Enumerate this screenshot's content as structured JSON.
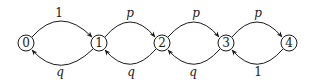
{
  "diagram": {
    "type": "markov-chain",
    "nodes": [
      {
        "id": "0",
        "label": "0",
        "x": 26,
        "y": 43
      },
      {
        "id": "1",
        "label": "1",
        "x": 99,
        "y": 43
      },
      {
        "id": "2",
        "label": "2",
        "x": 162,
        "y": 43
      },
      {
        "id": "3",
        "label": "3",
        "x": 226,
        "y": 43
      },
      {
        "id": "4",
        "label": "4",
        "x": 289,
        "y": 43
      }
    ],
    "edges": [
      {
        "from": "0",
        "to": "1",
        "label": "1",
        "direction": "forward"
      },
      {
        "from": "1",
        "to": "2",
        "label": "p",
        "direction": "forward"
      },
      {
        "from": "2",
        "to": "3",
        "label": "p",
        "direction": "forward"
      },
      {
        "from": "3",
        "to": "4",
        "label": "p",
        "direction": "forward"
      },
      {
        "from": "1",
        "to": "0",
        "label": "q",
        "direction": "backward"
      },
      {
        "from": "2",
        "to": "1",
        "label": "q",
        "direction": "backward"
      },
      {
        "from": "3",
        "to": "2",
        "label": "q",
        "direction": "backward"
      },
      {
        "from": "4",
        "to": "3",
        "label": "1",
        "direction": "backward"
      }
    ],
    "colors": {
      "stroke": "#1a1a1a",
      "background": "#ffffff"
    }
  }
}
